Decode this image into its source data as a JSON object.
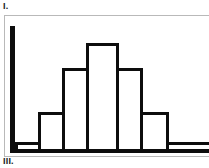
{
  "figure": {
    "label_top": "I.",
    "label_bottom": "III.",
    "frame_color": "#b9b9b9",
    "ink_color": "#0d0d0d",
    "background_color": "#ffffff"
  },
  "chart_data": {
    "type": "bar",
    "title": "I.",
    "subtitle": "",
    "xlabel": "",
    "ylabel": "",
    "grid": false,
    "legend": null,
    "axis_spike": {
      "present": true,
      "note": "solid black vertical axis line at left edge",
      "value": 100
    },
    "categories": [
      "1",
      "2",
      "3",
      "4",
      "5",
      "6",
      "7"
    ],
    "values": [
      6,
      30,
      66,
      86,
      66,
      30,
      6
    ],
    "xlim": [
      0,
      7
    ],
    "ylim": [
      0,
      100
    ],
    "bars": [
      {
        "name": "bar-1",
        "x": 0,
        "width": 24,
        "height": 6,
        "value": 6
      },
      {
        "name": "bar-2",
        "x": 24,
        "width": 25,
        "height": 30,
        "value": 30
      },
      {
        "name": "bar-3",
        "x": 49,
        "width": 25,
        "height": 66,
        "value": 66
      },
      {
        "name": "bar-4",
        "x": 74,
        "width": 32,
        "height": 86,
        "value": 86
      },
      {
        "name": "bar-5",
        "x": 106,
        "width": 25,
        "height": 66,
        "value": 66
      },
      {
        "name": "bar-6",
        "x": 131,
        "width": 27,
        "height": 30,
        "value": 30
      },
      {
        "name": "bar-7",
        "x": 158,
        "width": 47,
        "height": 6,
        "value": 6
      }
    ]
  }
}
